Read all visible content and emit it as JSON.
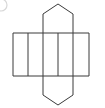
{
  "figure": {
    "stroke_color": "#3a3a3a",
    "fill_color": "#ffffff",
    "background_color": "#ffffff",
    "marker_color": "#d8d8d8"
  },
  "geometry": {
    "canvas": {
      "width": 105,
      "height": 108
    },
    "band": {
      "name": "rectangle-strip",
      "left": 13,
      "right": 89,
      "top": 33,
      "bottom": 76,
      "cell_count": 5,
      "divider_x": [
        13,
        28,
        43,
        58,
        73,
        89
      ],
      "cells": [
        {
          "label": "face-1",
          "x1": 13,
          "x2": 28
        },
        {
          "label": "face-2",
          "x1": 28,
          "x2": 43
        },
        {
          "label": "face-3",
          "x1": 43,
          "x2": 58
        },
        {
          "label": "face-4",
          "x1": 58,
          "x2": 73
        },
        {
          "label": "face-5",
          "x1": 73,
          "x2": 89
        }
      ]
    },
    "pentagon_top": {
      "name": "top-pentagon",
      "points": "43,33 43,14 58,4 73,14 73,33",
      "apex": {
        "x": 58,
        "y": 4
      },
      "base_y": 33
    },
    "pentagon_bottom": {
      "name": "bottom-pentagon",
      "points": "43,76 43,95 58,105 73,95 73,76",
      "apex": {
        "x": 58,
        "y": 105
      },
      "base_y": 76
    },
    "corner_marker": {
      "name": "corner-circle",
      "cx": 1,
      "cy": 5,
      "r": 6
    }
  },
  "chart_data": {
    "type": "diagram",
    "shapes": [
      {
        "shape": "pentagon",
        "position": "top",
        "sides": 5
      },
      {
        "shape": "rectangle",
        "position": "strip",
        "count": 5
      },
      {
        "shape": "pentagon",
        "position": "bottom",
        "sides": 5
      }
    ]
  }
}
